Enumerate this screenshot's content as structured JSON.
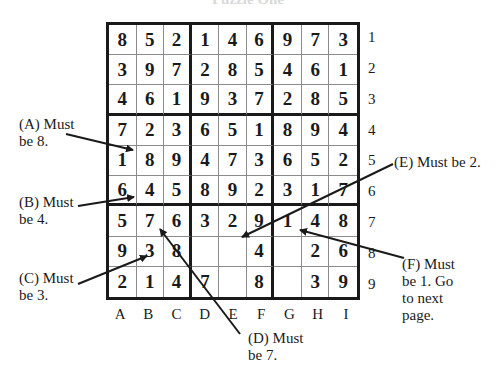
{
  "title": "Puzzle One",
  "grid": {
    "rows": [
      [
        "8",
        "5",
        "2",
        "1",
        "4",
        "6",
        "9",
        "7",
        "3"
      ],
      [
        "3",
        "9",
        "7",
        "2",
        "8",
        "5",
        "4",
        "6",
        "1"
      ],
      [
        "4",
        "6",
        "1",
        "9",
        "3",
        "7",
        "2",
        "8",
        "5"
      ],
      [
        "7",
        "2",
        "3",
        "6",
        "5",
        "1",
        "8",
        "9",
        "4"
      ],
      [
        "1",
        "8",
        "9",
        "4",
        "7",
        "3",
        "6",
        "5",
        "2"
      ],
      [
        "6",
        "4",
        "5",
        "8",
        "9",
        "2",
        "3",
        "1",
        "7"
      ],
      [
        "5",
        "7",
        "6",
        "3",
        "2",
        "9",
        "1",
        "4",
        "8"
      ],
      [
        "9",
        "3",
        "8",
        "",
        "",
        "4",
        "",
        "2",
        "6"
      ],
      [
        "2",
        "1",
        "4",
        "7",
        "",
        "8",
        "",
        "3",
        "9"
      ]
    ]
  },
  "row_labels": [
    "1",
    "2",
    "3",
    "4",
    "5",
    "6",
    "7",
    "8",
    "9"
  ],
  "col_labels": [
    "A",
    "B",
    "C",
    "D",
    "E",
    "F",
    "G",
    "H",
    "I"
  ],
  "annotations": [
    {
      "id": "A",
      "text": "(A) Must\nbe 8."
    },
    {
      "id": "B",
      "text": "(B) Must\nbe 4."
    },
    {
      "id": "C",
      "text": "(C) Must\nbe 3."
    },
    {
      "id": "D",
      "text": "(D) Must\nbe 7."
    },
    {
      "id": "E",
      "text": "(E) Must be 2."
    },
    {
      "id": "F",
      "text": "(F) Must\nbe 1. Go\nto next\npage."
    }
  ],
  "colors": {
    "ink": "#1a1a1a",
    "thin_line": "#8a8a8a",
    "background": "#ffffff"
  }
}
